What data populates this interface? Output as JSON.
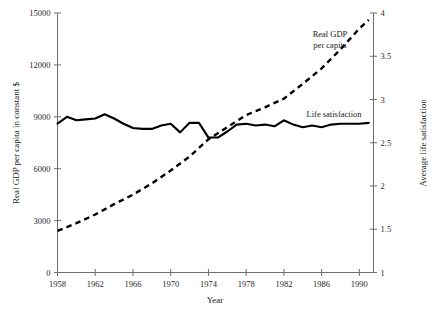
{
  "chart_data": {
    "type": "line",
    "title": "",
    "xlabel": "Year",
    "ylabel": "Real GDP per capita in constant $",
    "y2label": "Average life satisfaction",
    "xlim": [
      1958,
      1991.5
    ],
    "ylim": [
      0,
      15000
    ],
    "y2lim": [
      1,
      4
    ],
    "grid": false,
    "legend_position": "inline-annotations",
    "xticks": [
      1958,
      1962,
      1966,
      1970,
      1974,
      1978,
      1982,
      1986,
      1990
    ],
    "xticklabels": [
      "1958",
      "1962",
      "1966",
      "1970",
      "1974",
      "1978",
      "1982",
      "1986",
      "1990"
    ],
    "yticks": [
      0,
      3000,
      6000,
      9000,
      12000,
      15000
    ],
    "yticklabels": [
      "0",
      "3000",
      "6000",
      "9000",
      "12000",
      "15000"
    ],
    "y2ticks": [
      1,
      1.5,
      2,
      2.5,
      3,
      3.5,
      4
    ],
    "y2ticklabels": [
      "1",
      "1.5",
      "2",
      "2.5",
      "3",
      "3.5",
      "4"
    ],
    "annotations": [
      {
        "text_line1": "Real GDP",
        "text_line2": "per capita",
        "x": 1984.2,
        "y_px": 38
      },
      {
        "text_line1": "Life satisfaction",
        "text_line2": "",
        "x": 1985.0,
        "y_px": 117
      }
    ],
    "series": [
      {
        "name": "Life satisfaction",
        "axis": "right",
        "style": "solid",
        "x": [
          1958,
          1959,
          1960,
          1961,
          1962,
          1963,
          1964,
          1965,
          1966,
          1967,
          1968,
          1969,
          1970,
          1971,
          1972,
          1973,
          1974,
          1975,
          1976,
          1977,
          1978,
          1979,
          1980,
          1981,
          1982,
          1983,
          1984,
          1985,
          1986,
          1987,
          1988,
          1989,
          1990,
          1991
        ],
        "values": [
          2.72,
          2.8,
          2.76,
          2.77,
          2.78,
          2.83,
          2.78,
          2.72,
          2.67,
          2.66,
          2.66,
          2.7,
          2.72,
          2.62,
          2.73,
          2.73,
          2.56,
          2.56,
          2.63,
          2.71,
          2.72,
          2.7,
          2.71,
          2.69,
          2.76,
          2.71,
          2.68,
          2.7,
          2.68,
          2.71,
          2.72,
          2.72,
          2.72,
          2.73
        ]
      },
      {
        "name": "Real GDP per capita",
        "axis": "left",
        "style": "dashed",
        "x": [
          1958,
          1960,
          1962,
          1964,
          1966,
          1968,
          1970,
          1972,
          1974,
          1976,
          1978,
          1980,
          1982,
          1984,
          1986,
          1988,
          1990,
          1991
        ],
        "values": [
          2400,
          2850,
          3350,
          3950,
          4500,
          5150,
          5900,
          6700,
          7700,
          8400,
          9100,
          9550,
          10050,
          10900,
          11800,
          12900,
          14100,
          14600
        ]
      }
    ]
  },
  "axes": {
    "x_title": "Year",
    "y_left_title": "Real GDP per capita in constant $",
    "y_right_title": "Average life satisfaction"
  }
}
